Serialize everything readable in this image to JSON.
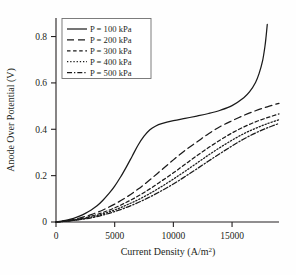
{
  "chart_data": {
    "type": "line",
    "title": "",
    "xlabel": "Current Density (A/m²)",
    "ylabel": "Anode Over Potential (V)",
    "xlim": [
      0,
      19000
    ],
    "ylim": [
      0,
      0.88
    ],
    "xticks": [
      0,
      5000,
      10000,
      15000
    ],
    "xticklabels": [
      "0",
      "5000",
      "10000",
      "15000"
    ],
    "yticks": [
      0,
      0.2,
      0.4,
      0.6,
      0.8
    ],
    "yticklabels": [
      "0",
      "0.2",
      "0.4",
      "0.6",
      "0.8"
    ],
    "grid": false,
    "legend_position": "upper-left",
    "legend_entries": [
      "P = 100 kPa",
      "P = 200 kPa",
      "P = 300 kPa",
      "P = 400 kPa",
      "P = 500 kPa"
    ],
    "series": [
      {
        "name": "P = 100 kPa",
        "linestyle": "solid",
        "dasharray": "none",
        "color": "#1a1a1a",
        "x": [
          0,
          500,
          1000,
          1500,
          2000,
          2500,
          3000,
          3500,
          4000,
          4500,
          5000,
          5500,
          6000,
          6500,
          7000,
          7500,
          8000,
          8500,
          9000,
          10000,
          11000,
          12000,
          13000,
          14000,
          15000,
          16000,
          16500,
          17000,
          17300,
          17600,
          17800,
          17900,
          18000
        ],
        "y": [
          0,
          0.004,
          0.009,
          0.016,
          0.025,
          0.037,
          0.052,
          0.07,
          0.094,
          0.122,
          0.155,
          0.194,
          0.238,
          0.285,
          0.332,
          0.37,
          0.398,
          0.414,
          0.424,
          0.437,
          0.447,
          0.457,
          0.468,
          0.482,
          0.502,
          0.536,
          0.562,
          0.602,
          0.64,
          0.695,
          0.757,
          0.8,
          0.852
        ]
      },
      {
        "name": "P = 200 kPa",
        "linestyle": "long-dash",
        "dasharray": "7,4",
        "color": "#1a1a1a",
        "x": [
          0,
          1000,
          2000,
          3000,
          4000,
          5000,
          6000,
          7000,
          8000,
          9000,
          10000,
          11000,
          12000,
          13000,
          14000,
          15000,
          16000,
          17000,
          18000,
          19000
        ],
        "y": [
          0,
          0.006,
          0.017,
          0.032,
          0.052,
          0.077,
          0.107,
          0.142,
          0.182,
          0.225,
          0.268,
          0.309,
          0.345,
          0.381,
          0.412,
          0.437,
          0.46,
          0.48,
          0.497,
          0.512
        ]
      },
      {
        "name": "P = 300 kPa",
        "linestyle": "short-dash",
        "dasharray": "3.5,2.6",
        "color": "#1a1a1a",
        "x": [
          0,
          1000,
          2000,
          3000,
          4000,
          5000,
          6000,
          7000,
          8000,
          9000,
          10000,
          11000,
          12000,
          13000,
          14000,
          15000,
          16000,
          17000,
          18000,
          19000
        ],
        "y": [
          0,
          0.005,
          0.013,
          0.025,
          0.041,
          0.061,
          0.085,
          0.112,
          0.143,
          0.177,
          0.212,
          0.249,
          0.286,
          0.321,
          0.354,
          0.384,
          0.41,
          0.432,
          0.45,
          0.466
        ]
      },
      {
        "name": "P = 400 kPa",
        "linestyle": "dotted",
        "dasharray": "1.3,1.9",
        "color": "#1a1a1a",
        "x": [
          0,
          1000,
          2000,
          3000,
          4000,
          5000,
          6000,
          7000,
          8000,
          9000,
          10000,
          11000,
          12000,
          13000,
          14000,
          15000,
          16000,
          17000,
          18000,
          19000
        ],
        "y": [
          0,
          0.004,
          0.011,
          0.021,
          0.035,
          0.052,
          0.073,
          0.096,
          0.123,
          0.153,
          0.185,
          0.219,
          0.254,
          0.289,
          0.322,
          0.353,
          0.381,
          0.404,
          0.424,
          0.441
        ]
      },
      {
        "name": "P = 500 kPa",
        "linestyle": "dash-dot",
        "dasharray": "5,2,1.3,2",
        "color": "#1a1a1a",
        "x": [
          0,
          1000,
          2000,
          3000,
          4000,
          5000,
          6000,
          7000,
          8000,
          9000,
          10000,
          11000,
          12000,
          13000,
          14000,
          15000,
          16000,
          17000,
          18000,
          19000
        ],
        "y": [
          0,
          0.004,
          0.01,
          0.018,
          0.03,
          0.045,
          0.063,
          0.084,
          0.108,
          0.135,
          0.164,
          0.196,
          0.229,
          0.263,
          0.296,
          0.328,
          0.358,
          0.384,
          0.406,
          0.425
        ]
      }
    ]
  }
}
